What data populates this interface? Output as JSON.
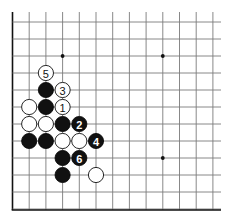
{
  "diagram": {
    "type": "go-board-fragment",
    "grid": {
      "columns": 13,
      "rows": 12,
      "origin_x": 12.5,
      "origin_y": 22,
      "spacing_x": 16.7,
      "spacing_y": 17.0,
      "line_top_extend": 12,
      "line_right_extend": 221,
      "borders": [
        "left",
        "bottom"
      ],
      "colors": {
        "line": "#7a7a7a",
        "border": "#111111",
        "background": "#ffffff"
      }
    },
    "star_points": [
      {
        "col": 3,
        "row": 2
      },
      {
        "col": 9,
        "row": 2
      },
      {
        "col": 9,
        "row": 8
      }
    ],
    "stones": [
      {
        "color": "white",
        "col": 2,
        "row": 3,
        "label": "5"
      },
      {
        "color": "black",
        "col": 2,
        "row": 4,
        "label": ""
      },
      {
        "color": "white",
        "col": 3,
        "row": 4,
        "label": "3"
      },
      {
        "color": "white",
        "col": 1,
        "row": 5,
        "label": ""
      },
      {
        "color": "black",
        "col": 2,
        "row": 5,
        "label": ""
      },
      {
        "color": "white",
        "col": 3,
        "row": 5,
        "label": "1"
      },
      {
        "color": "white",
        "col": 1,
        "row": 6,
        "label": ""
      },
      {
        "color": "white",
        "col": 2,
        "row": 6,
        "label": ""
      },
      {
        "color": "black",
        "col": 3,
        "row": 6,
        "label": ""
      },
      {
        "color": "black",
        "col": 4,
        "row": 6,
        "label": "2"
      },
      {
        "color": "black",
        "col": 1,
        "row": 7,
        "label": ""
      },
      {
        "color": "black",
        "col": 2,
        "row": 7,
        "label": ""
      },
      {
        "color": "white",
        "col": 3,
        "row": 7,
        "label": ""
      },
      {
        "color": "white",
        "col": 4,
        "row": 7,
        "label": ""
      },
      {
        "color": "black",
        "col": 5,
        "row": 7,
        "label": "4"
      },
      {
        "color": "black",
        "col": 3,
        "row": 8,
        "label": ""
      },
      {
        "color": "black",
        "col": 4,
        "row": 8,
        "label": "6"
      },
      {
        "color": "black",
        "col": 3,
        "row": 9,
        "label": ""
      },
      {
        "color": "white",
        "col": 5,
        "row": 9,
        "label": ""
      }
    ],
    "stone_radius": 8
  }
}
